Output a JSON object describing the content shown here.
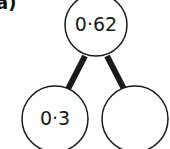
{
  "part_label": "a)",
  "tree": {
    "root": {
      "value": "0·62"
    },
    "left": {
      "value": "0·3"
    },
    "right": {
      "value": ""
    }
  },
  "colors": {
    "stroke": "#1a1a1a",
    "fill": "#ffffff"
  }
}
